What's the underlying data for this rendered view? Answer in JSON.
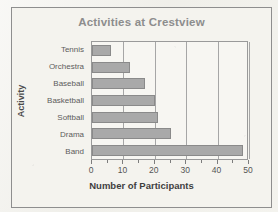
{
  "chart_data": {
    "type": "bar",
    "orientation": "horizontal",
    "title": "Activities at Crestview",
    "xlabel": "Number of Participants",
    "ylabel": "Activity",
    "categories": [
      "Tennis",
      "Orchestra",
      "Baseball",
      "Basketball",
      "Softball",
      "Drama",
      "Band"
    ],
    "values": [
      6,
      12,
      17,
      20,
      21,
      25,
      48
    ],
    "xlim": [
      0,
      50
    ],
    "xticks": [
      0,
      10,
      20,
      30,
      40,
      50
    ],
    "xtick_labels": [
      "0",
      "10",
      "20",
      "30",
      "40",
      "50"
    ],
    "minor_tick_interval": 5,
    "grid": "vertical",
    "legend": "none",
    "bar_color": "#a9a9a9",
    "bar_border_color": "#8a8a8a",
    "title_color": "#8d8d8d",
    "gridline_color": "#a6a6a6",
    "plot_background": "#f7f6f2",
    "page_background": "#f1f0eb"
  }
}
